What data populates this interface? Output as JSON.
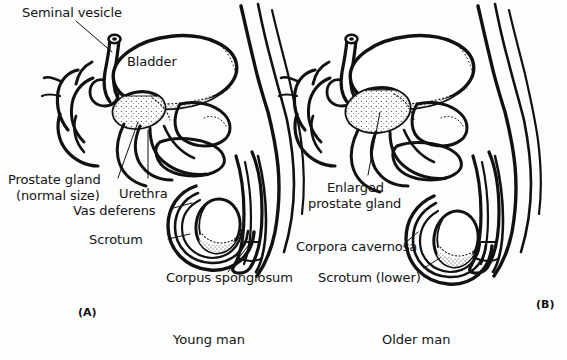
{
  "figure": {
    "background_color": "#fdfdfd",
    "ink_color": "#111111",
    "type": "anatomical-line-drawing"
  },
  "panels": [
    {
      "id": "(A)",
      "caption": "Young man",
      "labels": [
        "Seminal vesicle",
        "Bladder",
        "Prostate gland",
        "(normal size)",
        "Urethra",
        "Vas deferens",
        "Scrotum",
        "Corpus spongiosum"
      ]
    },
    {
      "id": "(B)",
      "caption": "Older man",
      "labels": [
        "Enlarged",
        "prostate gland",
        "Corpora cavernosa",
        "Scrotum (lower)"
      ]
    }
  ],
  "labels": {
    "seminal_vesicle": "Seminal vesicle",
    "bladder": "Bladder",
    "prostate_gland_l1": "Prostate gland",
    "prostate_gland_l2": "(normal size)",
    "urethra": "Urethra",
    "vas_deferens": "Vas deferens",
    "scrotum": "Scrotum",
    "corpus_spongiosum": "Corpus spongiosum",
    "corpora_cavernosa": "Corpora cavernosa",
    "enlarged_l1": "Enlarged",
    "enlarged_l2": "prostate gland",
    "scrotum_lower": "Scrotum (lower)"
  },
  "captions": {
    "panel_a_id": "(A)",
    "panel_b_id": "(B)",
    "young_man": "Young man",
    "older_man": "Older man"
  }
}
